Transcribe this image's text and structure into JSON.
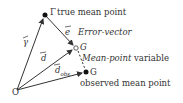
{
  "diagram": {
    "points": {
      "origin": {
        "label": "O",
        "x": 17,
        "y": 90
      },
      "gamma": {
        "label": "Γ",
        "description": "true mean point",
        "x": 45,
        "y": 15
      },
      "g_variable": {
        "label": "G",
        "description_italic": "Mean-point",
        "description_rest": " variable",
        "x": 76,
        "y": 48
      },
      "g_observed": {
        "label": "G",
        "description": "observed mean point",
        "x": 86,
        "y": 72
      }
    },
    "vectors": {
      "gamma_vec": {
        "label": "γ",
        "from": "origin",
        "to": "gamma"
      },
      "d_vec": {
        "label": "d",
        "from": "origin",
        "to": "g_variable"
      },
      "d_obs_vec": {
        "label": "d",
        "subscript": "obs",
        "from": "origin",
        "to": "g_observed"
      },
      "error_vec": {
        "label": "e",
        "description": "Error-vector",
        "from": "gamma",
        "to": "g_variable"
      }
    },
    "dashed_link": {
      "from": "g_variable",
      "to": "g_observed"
    },
    "colors": {
      "line": "#333333",
      "point": "#111111",
      "background": "#ffffff"
    }
  }
}
